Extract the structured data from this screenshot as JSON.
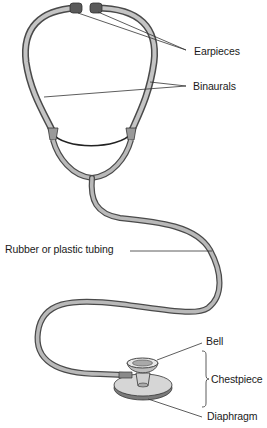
{
  "diagram": {
    "labels": {
      "earpieces": "Earpieces",
      "binaurals": "Binaurals",
      "tubing": "Rubber or plastic tubing",
      "bell": "Bell",
      "chestpiece": "Chestpiece",
      "diaphragm": "Diaphragm"
    },
    "colors": {
      "tube_fill": "#b9b9b9",
      "tube_edge": "#4a4a4a",
      "earpiece": "#5a5a5a",
      "leader_line": "#333333",
      "text": "#1a1a1a"
    }
  }
}
